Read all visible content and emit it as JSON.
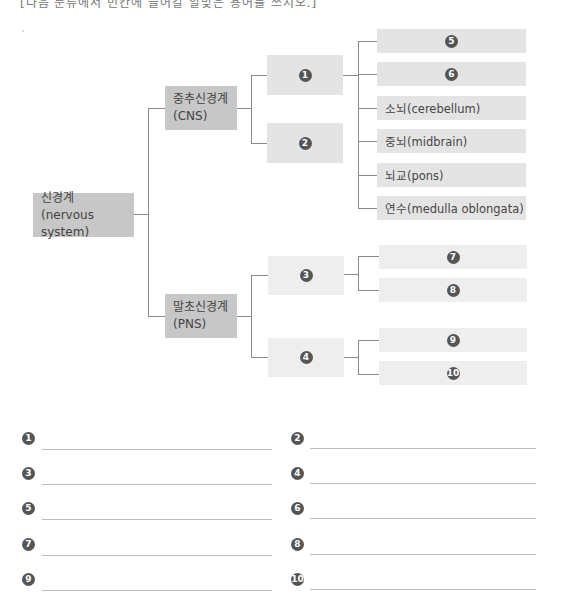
{
  "header": {
    "clipped_instruction": "[다음 분류에서 빈칸에 들어갈 알맞은 용어를 쓰시오.]"
  },
  "diagram": {
    "root": {
      "title": "신경계",
      "subtitle": "(nervous system)"
    },
    "cns": {
      "title": "중추신경계",
      "subtitle": "(CNS)",
      "children": [
        {
          "marker": "1"
        },
        {
          "marker": "2"
        }
      ],
      "brain_parts": [
        {
          "marker": "5",
          "label": ""
        },
        {
          "marker": "6",
          "label": ""
        },
        {
          "marker": "",
          "label": "소뇌(cerebellum)"
        },
        {
          "marker": "",
          "label": "중뇌(midbrain)"
        },
        {
          "marker": "",
          "label": "뇌교(pons)"
        },
        {
          "marker": "",
          "label": "연수(medulla oblongata)"
        }
      ]
    },
    "pns": {
      "title": "말초신경계",
      "subtitle": "(PNS)",
      "children": [
        {
          "marker": "3",
          "sub": [
            {
              "marker": "7"
            },
            {
              "marker": "8"
            }
          ]
        },
        {
          "marker": "4",
          "sub": [
            {
              "marker": "9"
            },
            {
              "marker": "10"
            }
          ]
        }
      ]
    }
  },
  "answers": [
    {
      "marker": "1",
      "value": ""
    },
    {
      "marker": "2",
      "value": ""
    },
    {
      "marker": "3",
      "value": ""
    },
    {
      "marker": "4",
      "value": ""
    },
    {
      "marker": "5",
      "value": ""
    },
    {
      "marker": "6",
      "value": ""
    },
    {
      "marker": "7",
      "value": ""
    },
    {
      "marker": "8",
      "value": ""
    },
    {
      "marker": "9",
      "value": ""
    },
    {
      "marker": "10",
      "value": ""
    }
  ],
  "colors": {
    "dark_box": "#c7c7c7",
    "mid_box": "#e4e4e4",
    "light_box": "#eeeeee",
    "connector": "#8a8a8a",
    "marker": "#555555"
  }
}
